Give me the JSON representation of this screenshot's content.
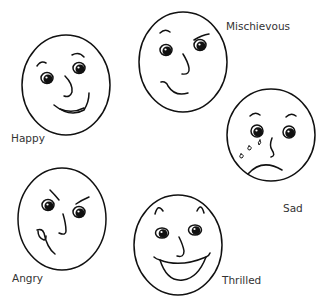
{
  "faces": [
    {
      "name": "happy",
      "label": "Happy"
    },
    {
      "name": "mischievous",
      "label": "Mischievous"
    },
    {
      "name": "sad",
      "label": "Sad"
    },
    {
      "name": "angry",
      "label": "Angry"
    },
    {
      "name": "thrilled",
      "label": "Thrilled"
    }
  ],
  "colors": {
    "line": "#111111",
    "text": "#333333",
    "background": "#ffffff"
  }
}
